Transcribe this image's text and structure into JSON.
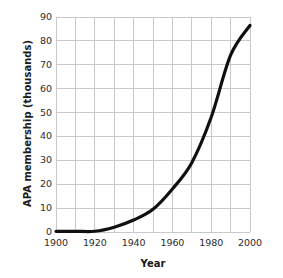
{
  "chart_data": {
    "type": "line",
    "title": "",
    "xlabel": "Year",
    "ylabel": "APA membership (thousands)",
    "xlim": [
      1900,
      2000
    ],
    "ylim": [
      0,
      90
    ],
    "xticks": [
      1900,
      1910,
      1920,
      1930,
      1940,
      1950,
      1960,
      1970,
      1980,
      1990,
      2000
    ],
    "xtick_labels": [
      "1900",
      "",
      "1920",
      "",
      "1940",
      "",
      "1960",
      "",
      "1980",
      "",
      "2000"
    ],
    "xtick_labels_shown": [
      "1900",
      "1920",
      "1940",
      "1960",
      "1980",
      "2000"
    ],
    "yticks": [
      0,
      10,
      20,
      30,
      40,
      50,
      60,
      70,
      80,
      90
    ],
    "ytick_labels": [
      "0",
      "10",
      "20",
      "30",
      "40",
      "50",
      "60",
      "70",
      "80",
      "90"
    ],
    "grid": true,
    "grid_color": "#c9c9c9",
    "legend": false,
    "legend_position": "none",
    "line_color": "#101010",
    "line_width": 3.2,
    "x": [
      1900,
      1910,
      1920,
      1930,
      1940,
      1950,
      1960,
      1970,
      1980,
      1990,
      2000
    ],
    "values": [
      0.3,
      0.3,
      0.3,
      2.0,
      5.0,
      9.5,
      18.0,
      29.0,
      48.0,
      74.0,
      86.5
    ],
    "series": [
      {
        "name": "APA membership",
        "values": [
          0.3,
          0.3,
          0.3,
          2.0,
          5.0,
          9.5,
          18.0,
          29.0,
          48.0,
          74.0,
          86.5
        ]
      }
    ]
  },
  "axes": {
    "x_title": "Year",
    "y_title": "APA membership (thousands)"
  }
}
